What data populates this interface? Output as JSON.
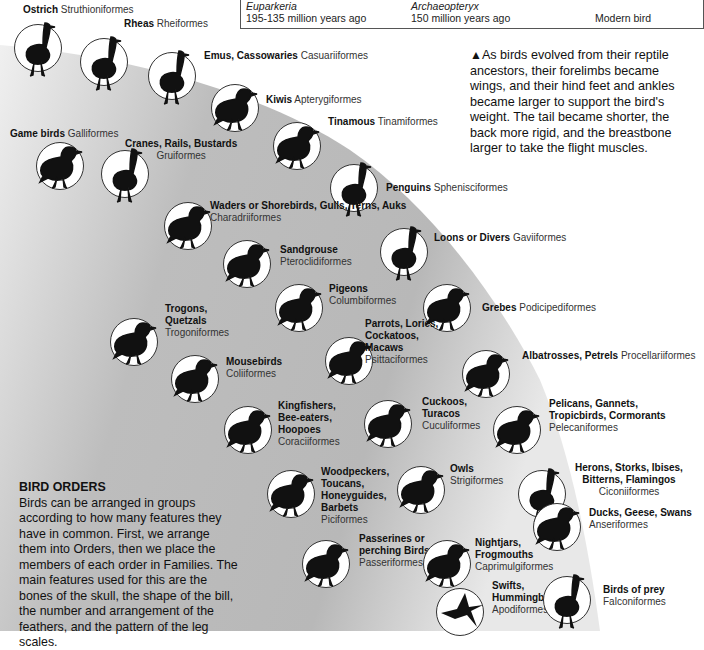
{
  "evolution_box": {
    "items": [
      {
        "species": "Euparkeria",
        "age": "195-135 million years ago"
      },
      {
        "species": "Archaeopteryx",
        "age": "150 million years ago"
      },
      {
        "species": "",
        "age": "Modern bird"
      }
    ]
  },
  "note": {
    "marker": "▲",
    "text": "As birds evolved from their reptile ancestors, their forelimbs became wings, and their hind feet and ankles became larger to support the bird's weight. The tail became shorter, the back more rigid, and the breastbone larger to take the flight muscles."
  },
  "intro": {
    "heading": "BIRD ORDERS",
    "text": "Birds can be arranged in groups according to how many features they have in common. First, we arrange them into Orders, then we place the members of each order in Families. The main features used for this are the bones of the skull, the shape of the bill, the number and arrangement of the feathers, and the pattern of the leg scales."
  },
  "colors": {
    "gradient_dark": "#a8a8a8",
    "gradient_light": "#f2f2f2",
    "silhouette": "#111111",
    "circle_fill": "#ffffff"
  },
  "orders": [
    {
      "common": "Ostrich",
      "order": "Struthioniformes",
      "icon": "ostrich-icon"
    },
    {
      "common": "Rheas",
      "order": "Rheiformes",
      "icon": "rhea-icon"
    },
    {
      "common": "Emus, Cassowaries",
      "order": "Casuariiformes",
      "icon": "emu-icon"
    },
    {
      "common": "Kiwis",
      "order": "Apterygiformes",
      "icon": "kiwi-icon"
    },
    {
      "common": "Tinamous",
      "order": "Tinamiformes",
      "icon": "tinamou-icon"
    },
    {
      "common": "Game birds",
      "order": "Galliformes",
      "icon": "game-bird-icon"
    },
    {
      "common": "Cranes, Rails, Bustards",
      "order": "Gruiformes",
      "icon": "bustard-icon"
    },
    {
      "common": "Penguins",
      "order": "Sphenisciformes",
      "icon": "penguin-icon"
    },
    {
      "common": "Waders or Shorebirds, Gulls, Terns, Auks",
      "order": "Charadriiformes",
      "icon": "gull-icon"
    },
    {
      "common": "Sandgrouse",
      "order": "Pteroclidiformes",
      "icon": "sandgrouse-icon"
    },
    {
      "common": "Loons or Divers",
      "order": "Gaviiformes",
      "icon": "loon-icon"
    },
    {
      "common": "Pigeons",
      "order": "Columbiformes",
      "icon": "pigeon-icon"
    },
    {
      "common": "Grebes",
      "order": "Podicipediformes",
      "icon": "grebe-icon"
    },
    {
      "common": "Trogons, Quetzals",
      "order": "Trogoniformes",
      "icon": "quetzal-icon"
    },
    {
      "common": "Parrots, Lories, Cockatoos, Macaws",
      "order": "Psittaciformes",
      "icon": "parrot-icon"
    },
    {
      "common": "Mousebirds",
      "order": "Coliiformes",
      "icon": "mousebird-icon"
    },
    {
      "common": "Albatrosses, Petrels",
      "order": "Procellariiformes",
      "icon": "albatross-icon"
    },
    {
      "common": "Kingfishers, Bee-eaters, Hoopoes",
      "order": "Coraciiformes",
      "icon": "kingfisher-icon"
    },
    {
      "common": "Cuckoos, Turacos",
      "order": "Cuculiformes",
      "icon": "cuckoo-icon"
    },
    {
      "common": "Pelicans, Gannets, Tropicbirds, Cormorants",
      "order": "Pelecaniformes",
      "icon": "pelican-icon"
    },
    {
      "common": "Woodpeckers, Toucans, Honeyguides, Barbets",
      "order": "Piciformes",
      "icon": "woodpecker-icon"
    },
    {
      "common": "Owls",
      "order": "Strigiformes",
      "icon": "owl-icon"
    },
    {
      "common": "Herons, Storks, Ibises, Bitterns, Flamingos",
      "order": "Ciconiiformes",
      "icon": "heron-icon"
    },
    {
      "common": "Passerines or perching Birds",
      "order": "Passeriformes",
      "icon": "passerine-icon"
    },
    {
      "common": "Nightjars, Frogmouths",
      "order": "Caprimulgiformes",
      "icon": "nightjar-icon"
    },
    {
      "common": "Ducks, Geese, Swans",
      "order": "Anseriformes",
      "icon": "duck-icon"
    },
    {
      "common": "Swifts, Hummingbirds",
      "order": "Apodiformes",
      "icon": "hummingbird-icon"
    },
    {
      "common": "Birds of prey",
      "order": "Falconiformes",
      "icon": "bird-of-prey-icon"
    }
  ]
}
